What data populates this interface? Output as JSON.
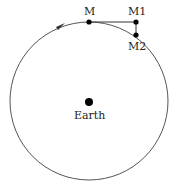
{
  "diagram": {
    "labels": {
      "m": "M",
      "m1": "M1",
      "m2": "M2",
      "earth": "Earth"
    },
    "colors": {
      "stroke": "#555555",
      "point": "#000000",
      "text": "#222222"
    }
  }
}
